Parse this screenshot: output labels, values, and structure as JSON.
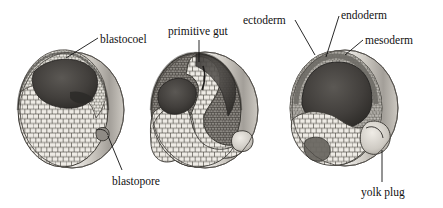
{
  "figure": {
    "background_color": "#ffffff",
    "ink_color": "#111111"
  },
  "labels": [
    {
      "id": "blastocoel",
      "text": "blastocoel",
      "x": 100,
      "y": 33,
      "align": "left"
    },
    {
      "id": "primitive-gut",
      "text": "primitive gut",
      "x": 168,
      "y": 25,
      "align": "left"
    },
    {
      "id": "ectoderm",
      "text": "ectoderm",
      "x": 243,
      "y": 14,
      "align": "left"
    },
    {
      "id": "endoderm",
      "text": "endoderm",
      "x": 341,
      "y": 9,
      "align": "left"
    },
    {
      "id": "mesoderm",
      "text": "mesoderm",
      "x": 365,
      "y": 34,
      "align": "left"
    },
    {
      "id": "blastopore",
      "text": "blastopore",
      "x": 112,
      "y": 175,
      "align": "left"
    },
    {
      "id": "yolk-plug",
      "text": "yolk plug",
      "x": 361,
      "y": 186,
      "align": "left"
    }
  ],
  "leader_lines": [
    {
      "id": "blastocoel-leader",
      "from": [
        98,
        38
      ],
      "to": [
        66,
        58
      ]
    },
    {
      "id": "primitive-gut-leader",
      "from": [
        199,
        40
      ],
      "to": [
        199,
        62
      ]
    },
    {
      "id": "ectoderm-leader",
      "from": [
        295,
        20
      ],
      "to": [
        315,
        55
      ]
    },
    {
      "id": "endoderm-leader",
      "from": [
        339,
        16
      ],
      "to": [
        326,
        57
      ]
    },
    {
      "id": "mesoderm-leader",
      "from": [
        363,
        40
      ],
      "to": [
        345,
        55
      ]
    },
    {
      "id": "blastopore-leader",
      "from": [
        122,
        170
      ],
      "to": [
        108,
        136
      ]
    },
    {
      "id": "yolk-plug-leader",
      "from": [
        382,
        182
      ],
      "to": [
        382,
        150
      ]
    }
  ],
  "embryos": [
    {
      "id": "embryo-blastula",
      "stage_name": "blastula",
      "center": [
        68,
        110
      ],
      "radius_x": 52,
      "radius_y": 58,
      "features": [
        "blastocoel",
        "blastopore",
        "animal pole cells",
        "vegetal yolk cells"
      ]
    },
    {
      "id": "embryo-early-gastrula",
      "stage_name": "early gastrula",
      "center": [
        200,
        110
      ],
      "radius_x": 54,
      "radius_y": 58,
      "features": [
        "primitive gut",
        "archenteron",
        "blastopore lip",
        "yolk cells"
      ]
    },
    {
      "id": "embryo-late-gastrula",
      "stage_name": "late gastrula",
      "center": [
        340,
        108
      ],
      "radius_x": 54,
      "radius_y": 58,
      "features": [
        "ectoderm",
        "endoderm",
        "mesoderm",
        "yolk plug"
      ]
    }
  ],
  "palette": {
    "outer_membrane_light": "#f3f1ee",
    "outer_membrane_shade": "#b9b5ae",
    "cell_fill_light": "#e9e6e0",
    "cell_outline": "#4a4741",
    "cavity_dark": "#4d4b47",
    "cavity_darker": "#343230",
    "germ_layer_mid": "#8d8a84"
  }
}
